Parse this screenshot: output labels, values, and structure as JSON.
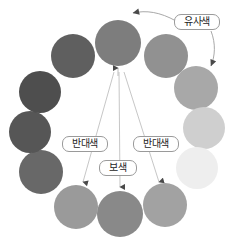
{
  "diagram": {
    "background": "#ffffff",
    "width": 244,
    "height": 247
  },
  "chart_data": {
    "type": "scatter",
    "title": "",
    "xlabel": "",
    "ylabel": "",
    "legend_position": "none",
    "grid": false,
    "categories": [
      "pos-12",
      "pos-1",
      "pos-2",
      "pos-3",
      "pos-4",
      "pos-5",
      "pos-6",
      "pos-7",
      "pos-8",
      "pos-9",
      "pos-10",
      "pos-11"
    ],
    "values": [
      50,
      42,
      33,
      25,
      20,
      36,
      46,
      40,
      34,
      28,
      24,
      30
    ],
    "series": [
      {
        "name": "swatch-lightness-percent",
        "values": [
          50,
          42,
          33,
          25,
          20,
          36,
          46,
          40,
          34,
          28,
          24,
          30
        ]
      }
    ],
    "swatches": [
      {
        "id": "swatch-top",
        "clock": 12,
        "x": 118,
        "y": 43,
        "r": 23,
        "color": "#7d7d7d"
      },
      {
        "id": "swatch-upper-right",
        "clock": 1,
        "x": 166,
        "y": 56,
        "r": 22,
        "color": "#919191"
      },
      {
        "id": "swatch-right-upper",
        "clock": 2,
        "x": 196,
        "y": 88,
        "r": 22,
        "color": "#a8a8a8"
      },
      {
        "id": "swatch-right",
        "clock": 3,
        "x": 204,
        "y": 128,
        "r": 21,
        "color": "#cfcfcf"
      },
      {
        "id": "swatch-right-lower",
        "clock": 4,
        "x": 197,
        "y": 168,
        "r": 21,
        "color": "#eeeeee"
      },
      {
        "id": "swatch-lower-right",
        "clock": 5,
        "x": 165,
        "y": 205,
        "r": 22,
        "color": "#a2a2a2"
      },
      {
        "id": "swatch-bottom",
        "clock": 6,
        "x": 120,
        "y": 214,
        "r": 23,
        "color": "#898989"
      },
      {
        "id": "swatch-lower-left",
        "clock": 7,
        "x": 76,
        "y": 207,
        "r": 22,
        "color": "#9a9a9a"
      },
      {
        "id": "swatch-left-lower",
        "clock": 8,
        "x": 41,
        "y": 172,
        "r": 22,
        "color": "#686868"
      },
      {
        "id": "swatch-left",
        "clock": 9,
        "x": 30,
        "y": 132,
        "r": 21,
        "color": "#565656"
      },
      {
        "id": "swatch-left-upper",
        "clock": 10,
        "x": 40,
        "y": 92,
        "r": 21,
        "color": "#4e4e4e"
      },
      {
        "id": "swatch-upper-left",
        "clock": 11,
        "x": 73,
        "y": 56,
        "r": 22,
        "color": "#5f5f5f"
      }
    ],
    "annotations": [
      {
        "id": "analogous",
        "label": "유사색",
        "box": {
          "x": 174,
          "y": 14,
          "w": 46,
          "h": 16
        },
        "arrows": [
          {
            "from": "label",
            "to": "swatch-top",
            "style": "curved-left"
          },
          {
            "from": "label",
            "to": "swatch-right-upper",
            "style": "curved-down-right"
          }
        ]
      },
      {
        "id": "opposite-left",
        "label": "반대색",
        "box": {
          "x": 62,
          "y": 136,
          "w": 46,
          "h": 16
        },
        "arrows": [
          {
            "from": "swatch-top",
            "to": "swatch-lower-left",
            "style": "straight"
          }
        ]
      },
      {
        "id": "opposite-right",
        "label": "반대색",
        "box": {
          "x": 133,
          "y": 136,
          "w": 46,
          "h": 16
        },
        "arrows": [
          {
            "from": "swatch-top",
            "to": "swatch-lower-right",
            "style": "straight"
          }
        ]
      },
      {
        "id": "complementary",
        "label": "보색",
        "box": {
          "x": 99,
          "y": 160,
          "w": 38,
          "h": 16
        },
        "arrows": [
          {
            "from": "swatch-top",
            "to": "swatch-bottom",
            "style": "straight"
          }
        ]
      }
    ],
    "colors": {
      "line": "#b4b4b4",
      "arrowhead": "#4a4a4a",
      "label_border": "#9a9a9a",
      "label_text": "#1d1d1d",
      "background": "#ffffff"
    }
  }
}
